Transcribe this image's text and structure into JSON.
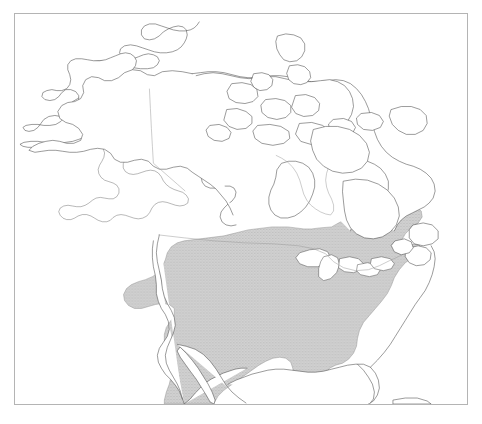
{
  "figure": {
    "type": "range-map",
    "region": "North America",
    "frame": {
      "x": 14,
      "y": 13,
      "width": 454,
      "height": 392,
      "border_color": "#b4b4b4"
    },
    "background_color": "#ffffff"
  },
  "map": {
    "projection_note": "conic, North America",
    "coastline_color": "#4a4a4a",
    "coastline_width": 0.55,
    "political_border_color": "#9a9a9a",
    "landmasses": [
      "Alaska",
      "Canada",
      "Arctic Archipelago",
      "Greenland edge",
      "Contiguous United States",
      "Mexico",
      "Baja California",
      "Newfoundland",
      "Nova Scotia",
      "Cuba"
    ],
    "water_features": [
      "Hudson Bay",
      "Great Lakes",
      "Gulf of Mexico",
      "Gulf of California",
      "Atlantic Ocean",
      "Pacific Ocean"
    ]
  },
  "legend": {
    "shaded_label": "Species distribution range",
    "shade_fill_color": "#cccccc",
    "shade_outline_color": "#8d8d8d",
    "shade_pattern": "fine stipple hatch"
  },
  "range": {
    "name": "eastern-north-america-range",
    "description": "Shaded distribution covering the eastern United States, extending north into southern Ontario, Quebec, New Brunswick and Nova Scotia, west to the eastern Great Plains and eastern Texas, and south along the Gulf coast into northeastern Mexico, including all of Florida.",
    "coverage_regions": [
      "Eastern United States",
      "Southern Ontario",
      "Southern Quebec",
      "New Brunswick",
      "Nova Scotia",
      "Florida",
      "Eastern Texas",
      "Northeastern Mexico coast"
    ]
  },
  "caption": {
    "text": ""
  }
}
